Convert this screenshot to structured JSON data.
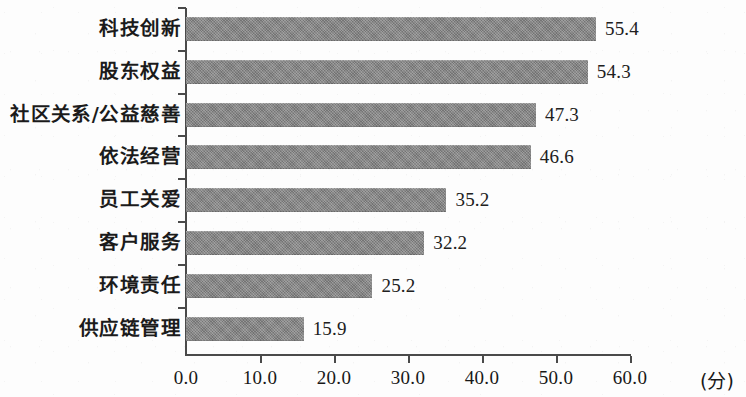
{
  "chart_data": {
    "type": "bar",
    "orientation": "horizontal",
    "title": "",
    "xlabel": "(分)",
    "ylabel": "",
    "xlim": [
      0.0,
      60.0
    ],
    "xticks": [
      "0.0",
      "10.0",
      "20.0",
      "30.0",
      "40.0",
      "50.0",
      "60.0"
    ],
    "xtick_values": [
      0,
      10,
      20,
      30,
      40,
      50,
      60
    ],
    "grid": false,
    "legend": null,
    "bar_color": "#818181",
    "categories": [
      "科技创新",
      "股东权益",
      "社区关系/公益慈善",
      "依法经营",
      "员工关爱",
      "客户服务",
      "环境责任",
      "供应链管理"
    ],
    "values": [
      55.4,
      54.3,
      47.3,
      46.6,
      35.2,
      32.2,
      25.2,
      15.9
    ],
    "value_labels": [
      "55.4",
      "54.3",
      "47.3",
      "46.6",
      "35.2",
      "32.2",
      "25.2",
      "15.9"
    ]
  }
}
